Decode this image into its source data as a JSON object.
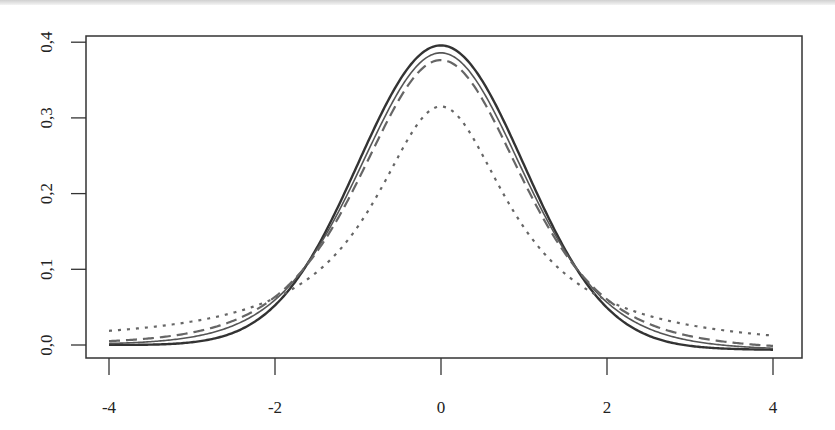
{
  "chart_data": {
    "type": "line",
    "title": "",
    "xlabel": "",
    "ylabel": "",
    "xlim": [
      -4,
      4
    ],
    "ylim": [
      0,
      0.4
    ],
    "grid": false,
    "legend": null,
    "x_ticks": [
      "-4",
      "-2",
      "0",
      "2",
      "4"
    ],
    "y_ticks": [
      "0,0",
      "0,1",
      "0,2",
      "0,3",
      "0,4"
    ],
    "x": [
      -4,
      -3.5,
      -3,
      -2.5,
      -2,
      -1.5,
      -1,
      -0.5,
      0,
      0.5,
      1,
      1.5,
      2,
      2.5,
      3,
      3.5,
      4
    ],
    "series": [
      {
        "name": "normal",
        "style": "solid-thick",
        "color": "#333333",
        "values": [
          0.0001,
          0.0009,
          0.0044,
          0.0175,
          0.054,
          0.1295,
          0.242,
          0.3521,
          0.3989,
          0.3521,
          0.242,
          0.1295,
          0.054,
          0.0175,
          0.0044,
          0.0009,
          0.0001
        ]
      },
      {
        "name": "t df=10",
        "style": "solid-thin",
        "color": "#555555",
        "values": [
          0.002,
          0.0043,
          0.0114,
          0.0279,
          0.0611,
          0.1274,
          0.2304,
          0.3397,
          0.3891,
          0.3397,
          0.2304,
          0.1274,
          0.0611,
          0.0279,
          0.0114,
          0.0043,
          0.002
        ]
      },
      {
        "name": "t df=5",
        "style": "dashed",
        "color": "#666666",
        "values": [
          0.0051,
          0.0088,
          0.0173,
          0.0361,
          0.0651,
          0.1245,
          0.2197,
          0.3279,
          0.3796,
          0.3279,
          0.2197,
          0.1245,
          0.0651,
          0.0361,
          0.0173,
          0.0088,
          0.0051
        ]
      },
      {
        "name": "t df=1 (Cauchy)",
        "style": "dotted",
        "color": "#666666",
        "values": [
          0.0187,
          0.0241,
          0.0318,
          0.0439,
          0.0637,
          0.0979,
          0.1592,
          0.2546,
          0.3183,
          0.2546,
          0.1592,
          0.0979,
          0.0637,
          0.0439,
          0.0318,
          0.0241,
          0.0187
        ]
      }
    ]
  }
}
